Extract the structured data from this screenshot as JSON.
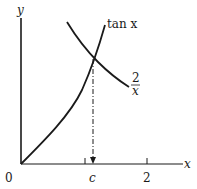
{
  "figure": {
    "axes": {
      "x_label": "x",
      "y_label": "y",
      "origin_label": "0",
      "x_tick_labels": [
        "c",
        "2"
      ],
      "unlabeled_ticks": [
        1
      ]
    },
    "curves": [
      {
        "name": "tan-x",
        "label": "tan x"
      },
      {
        "name": "two-over-x",
        "label_numerator": "2",
        "label_denominator": "x"
      }
    ],
    "intersection": {
      "label": "c",
      "x_value_approx": 1.08
    },
    "colors": {
      "ink": "#1a1a1a",
      "background": "#ffffff"
    }
  }
}
